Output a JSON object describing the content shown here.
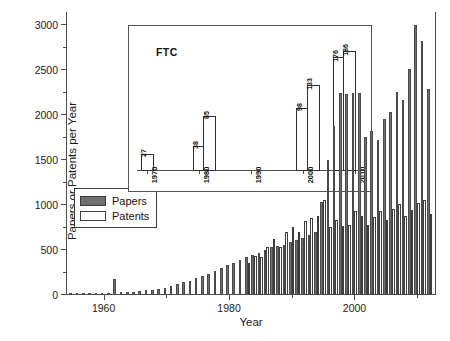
{
  "chart_data": {
    "type": "bar",
    "title": "",
    "xlabel": "Year",
    "ylabel": "Papers or Patents per Year",
    "xlim": [
      1954,
      2013
    ],
    "ylim": [
      0,
      3150
    ],
    "yticks": [
      0,
      500,
      1000,
      1500,
      2000,
      2500,
      3000
    ],
    "xticks": [
      1960,
      1980,
      2000
    ],
    "grid": false,
    "legend_position": "upper-left-inside",
    "colors": {
      "papers": "#6e6e6e",
      "patents": "#ffffff",
      "axis": "#4d4d4d",
      "outline": "#3c3c3c"
    },
    "legend": [
      {
        "name": "Papers",
        "swatch": "filled-gray"
      },
      {
        "name": "Patents",
        "swatch": "open-white"
      }
    ],
    "x": [
      1955,
      1956,
      1957,
      1958,
      1959,
      1960,
      1961,
      1962,
      1963,
      1964,
      1965,
      1966,
      1967,
      1968,
      1969,
      1970,
      1971,
      1972,
      1973,
      1974,
      1975,
      1976,
      1977,
      1978,
      1979,
      1980,
      1981,
      1982,
      1983,
      1984,
      1985,
      1986,
      1987,
      1988,
      1989,
      1990,
      1991,
      1992,
      1993,
      1994,
      1995,
      1996,
      1997,
      1998,
      1999,
      2000,
      2001,
      2002,
      2003,
      2004,
      2005,
      2006,
      2007,
      2008,
      2009,
      2010,
      2011,
      2012
    ],
    "series": [
      {
        "name": "Papers",
        "values": [
          5,
          8,
          10,
          12,
          14,
          18,
          22,
          175,
          30,
          35,
          38,
          45,
          52,
          58,
          66,
          74,
          95,
          118,
          140,
          160,
          185,
          210,
          235,
          265,
          300,
          330,
          360,
          395,
          420,
          450,
          470,
          500,
          530,
          545,
          560,
          590,
          610,
          640,
          670,
          700,
          1030,
          1500,
          1880,
          2250,
          2240,
          2250,
          2250,
          1760,
          1830,
          1720,
          1960,
          2040,
          2260,
          2170,
          2520,
          3000,
          2830,
          2290
        ]
      },
      {
        "name": "Patents",
        "values": [
          0,
          0,
          0,
          0,
          0,
          0,
          0,
          0,
          0,
          0,
          0,
          0,
          0,
          0,
          0,
          0,
          0,
          0,
          0,
          0,
          0,
          0,
          0,
          0,
          0,
          0,
          0,
          0,
          360,
          430,
          420,
          530,
          620,
          530,
          700,
          760,
          700,
          820,
          860,
          880,
          1060,
          760,
          830,
          770,
          780,
          930,
          880,
          780,
          870,
          930,
          830,
          960,
          1010,
          880,
          950,
          1020,
          1060,
          900
        ]
      }
    ],
    "inset": {
      "type": "bar",
      "title": "FTC",
      "xlim": [
        1968,
        2012
      ],
      "ylim": [
        0,
        215
      ],
      "xticks": [
        1970,
        1980,
        1990,
        2000,
        2010
      ],
      "xticklabels": [
        "1970",
        "1980",
        "1990",
        "2000",
        "2010"
      ],
      "bar_style": "open-white",
      "x": [
        1970,
        1980,
        1982,
        2000,
        2002,
        2007,
        2009
      ],
      "values": [
        27,
        38,
        85,
        98,
        133,
        176,
        186
      ],
      "value_labels": [
        "27",
        "38",
        "85",
        "98",
        "133",
        "176",
        "186"
      ]
    }
  }
}
